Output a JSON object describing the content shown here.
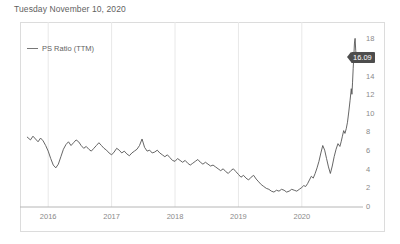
{
  "header": {
    "title": "Tuesday November 10, 2020"
  },
  "legend": {
    "items": [
      {
        "label": "PS Ratio (TTM)",
        "color": "#777777",
        "marker": "line-swatch"
      }
    ]
  },
  "badge": {
    "value": "16.09",
    "background": "#4d4d4d",
    "text_color": "#ffffff"
  },
  "caption": {
    "text": ""
  },
  "chart_data": {
    "type": "line",
    "title": "Tuesday November 10, 2020",
    "xlabel": "",
    "ylabel": "",
    "grid": true,
    "legend_position": "top-left",
    "xlim": [
      2015.65,
      2020.87
    ],
    "ylim": [
      0,
      19
    ],
    "yticks": [
      0,
      2,
      4,
      6,
      8,
      10,
      12,
      14,
      16,
      18
    ],
    "ytick_labels": [
      "0",
      "2",
      "4",
      "6",
      "8",
      "10",
      "12",
      "14",
      "16",
      "18"
    ],
    "ytick_hidden": [
      "16"
    ],
    "y_axis_side": "right",
    "xticks": [
      2016,
      2017,
      2018,
      2019,
      2020
    ],
    "xtick_labels": [
      "2016",
      "2017",
      "2018",
      "2019",
      "2020"
    ],
    "last_value": 16.09,
    "series": [
      {
        "name": "PS Ratio (TTM)",
        "color": "#555555",
        "x": [
          2015.67,
          2015.72,
          2015.76,
          2015.8,
          2015.84,
          2015.88,
          2015.92,
          2015.96,
          2016.0,
          2016.04,
          2016.08,
          2016.12,
          2016.16,
          2016.2,
          2016.24,
          2016.28,
          2016.32,
          2016.36,
          2016.4,
          2016.44,
          2016.48,
          2016.52,
          2016.56,
          2016.6,
          2016.64,
          2016.68,
          2016.72,
          2016.76,
          2016.8,
          2016.84,
          2016.88,
          2016.92,
          2016.96,
          2017.0,
          2017.04,
          2017.08,
          2017.12,
          2017.16,
          2017.2,
          2017.24,
          2017.28,
          2017.32,
          2017.36,
          2017.4,
          2017.44,
          2017.48,
          2017.52,
          2017.56,
          2017.6,
          2017.64,
          2017.68,
          2017.72,
          2017.76,
          2017.8,
          2017.84,
          2017.88,
          2017.92,
          2017.96,
          2018.0,
          2018.04,
          2018.08,
          2018.12,
          2018.16,
          2018.2,
          2018.24,
          2018.28,
          2018.32,
          2018.36,
          2018.4,
          2018.44,
          2018.48,
          2018.52,
          2018.56,
          2018.6,
          2018.64,
          2018.68,
          2018.72,
          2018.76,
          2018.8,
          2018.84,
          2018.88,
          2018.92,
          2018.96,
          2019.0,
          2019.04,
          2019.08,
          2019.12,
          2019.16,
          2019.2,
          2019.24,
          2019.28,
          2019.32,
          2019.36,
          2019.4,
          2019.44,
          2019.48,
          2019.52,
          2019.56,
          2019.6,
          2019.64,
          2019.68,
          2019.72,
          2019.76,
          2019.8,
          2019.84,
          2019.88,
          2019.92,
          2019.96,
          2020.0,
          2020.03,
          2020.06,
          2020.09,
          2020.12,
          2020.15,
          2020.18,
          2020.21,
          2020.24,
          2020.27,
          2020.3,
          2020.33,
          2020.36,
          2020.39,
          2020.42,
          2020.45,
          2020.48,
          2020.51,
          2020.54,
          2020.57,
          2020.6,
          2020.62,
          2020.64,
          2020.66,
          2020.68,
          2020.7,
          2020.72,
          2020.74,
          2020.76,
          2020.78,
          2020.79,
          2020.8,
          2020.81,
          2020.82,
          2020.83,
          2020.84,
          2020.85,
          2020.86
        ],
        "y": [
          7.5,
          7.2,
          7.6,
          7.3,
          7.0,
          7.4,
          7.1,
          6.6,
          6.0,
          5.2,
          4.5,
          4.2,
          4.6,
          5.4,
          6.2,
          6.7,
          7.0,
          6.6,
          6.9,
          7.2,
          7.0,
          6.6,
          6.3,
          6.5,
          6.2,
          6.0,
          6.3,
          6.6,
          6.9,
          6.6,
          6.3,
          6.1,
          5.8,
          5.6,
          5.9,
          6.3,
          6.1,
          5.8,
          6.0,
          5.7,
          5.5,
          5.8,
          6.0,
          6.2,
          6.6,
          7.3,
          6.4,
          6.0,
          6.1,
          5.8,
          5.9,
          6.1,
          5.8,
          5.6,
          5.4,
          5.6,
          5.3,
          5.0,
          4.9,
          5.2,
          5.0,
          4.8,
          5.0,
          4.7,
          4.5,
          4.7,
          4.9,
          5.1,
          4.8,
          4.6,
          4.8,
          4.6,
          4.4,
          4.5,
          4.3,
          4.1,
          3.9,
          4.1,
          3.8,
          3.6,
          3.9,
          4.1,
          3.8,
          3.5,
          3.2,
          3.4,
          3.1,
          2.9,
          3.2,
          3.4,
          3.0,
          2.7,
          2.4,
          2.2,
          2.0,
          1.9,
          1.7,
          1.6,
          1.8,
          1.7,
          1.9,
          1.8,
          1.6,
          1.7,
          1.9,
          1.8,
          1.7,
          1.9,
          2.1,
          2.3,
          2.2,
          2.5,
          2.9,
          3.3,
          3.1,
          3.6,
          4.2,
          4.9,
          5.8,
          6.6,
          6.1,
          5.2,
          4.3,
          3.6,
          4.4,
          5.4,
          6.2,
          6.8,
          6.5,
          7.0,
          7.6,
          8.2,
          7.9,
          8.4,
          9.1,
          10.2,
          11.4,
          12.7,
          12.1,
          13.4,
          14.9,
          16.2,
          17.6,
          18.1,
          16.8,
          16.09
        ]
      }
    ]
  }
}
